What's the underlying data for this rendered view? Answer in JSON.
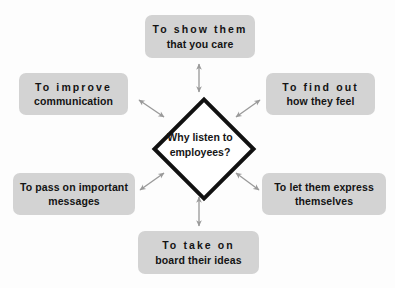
{
  "diagram": {
    "title": "Why listen to employees?",
    "center": {
      "line1": "Why listen to",
      "line2": "employees?"
    },
    "nodes": [
      {
        "id": "top",
        "line1": "To show them",
        "line2": "that  you  care",
        "tracked": false
      },
      {
        "id": "left-top",
        "line1": "To  improve",
        "line2": "communication",
        "tracked": true
      },
      {
        "id": "right-top",
        "line1": "To  find  out",
        "line2": "how they feel",
        "tracked": true
      },
      {
        "id": "left-bottom",
        "line1": "To pass on important",
        "line2": "messages",
        "tracked": false
      },
      {
        "id": "right-bottom",
        "line1": "To let them express",
        "line2": "themselves",
        "tracked": false
      },
      {
        "id": "bottom",
        "line1": "To take on",
        "line2": "board their ideas",
        "tracked": true
      }
    ],
    "colors": {
      "background": "#fdfdfd",
      "node_fill": "#d3d3d3",
      "node_text": "#141414",
      "diamond_stroke": "#111111",
      "diamond_fill": "#ffffff",
      "arrow": "#9a9a9a"
    },
    "connectors": [
      {
        "id": "arrow-top",
        "from": "center",
        "to": "top",
        "style": "double-headed"
      },
      {
        "id": "arrow-left-top",
        "from": "center",
        "to": "left-top",
        "style": "double-headed"
      },
      {
        "id": "arrow-right-top",
        "from": "center",
        "to": "right-top",
        "style": "double-headed"
      },
      {
        "id": "arrow-left-bottom",
        "from": "center",
        "to": "left-bottom",
        "style": "double-headed"
      },
      {
        "id": "arrow-right-bottom",
        "from": "center",
        "to": "right-bottom",
        "style": "double-headed"
      },
      {
        "id": "arrow-bottom",
        "from": "center",
        "to": "bottom",
        "style": "double-headed"
      }
    ]
  }
}
